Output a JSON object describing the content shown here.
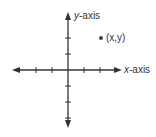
{
  "diagram": {
    "type": "cartesian-plane",
    "x_axis_label_var": "x",
    "x_axis_label_rest": "-axis",
    "y_axis_label_var": "y",
    "y_axis_label_rest": "-axis",
    "point_label": "(x,y)",
    "colors": {
      "axis": "#333333",
      "point": "#444444",
      "background": "#ffffff"
    },
    "origin": [
      68,
      70
    ],
    "tick_spacing": 16,
    "x_ticks_left": 3,
    "x_ticks_right": 2,
    "y_ticks_up": 2,
    "y_ticks_down": 3,
    "point_position": [
      101,
      38
    ]
  }
}
